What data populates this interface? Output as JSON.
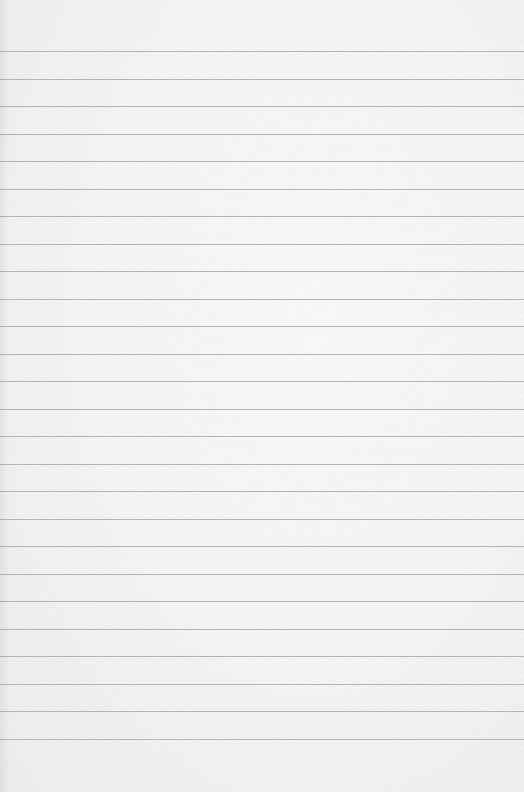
{
  "page": {
    "type": "lined-paper",
    "background_color": "#f3f3f2",
    "line_color": "#a9a9a9",
    "first_line_y": 51,
    "line_spacing": 27.5,
    "line_count": 26
  }
}
